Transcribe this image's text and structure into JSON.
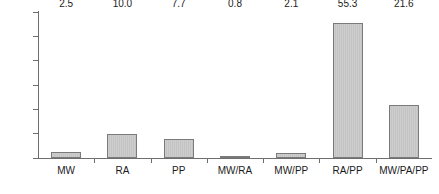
{
  "chart_data": {
    "type": "bar",
    "title": "",
    "subtitle": "",
    "xlabel": "",
    "ylabel": "",
    "categories": [
      "MW",
      "RA",
      "PP",
      "MW/RA",
      "MW/PP",
      "RA/PP",
      "MW/PA/PP"
    ],
    "values": [
      2.5,
      10.0,
      7.7,
      0.8,
      2.1,
      55.3,
      21.6
    ],
    "data_labels": [
      "2.5",
      "10.0",
      "7.7",
      "0.8",
      "2.1",
      "55.3",
      "21.6"
    ],
    "ylim": [
      0,
      60
    ],
    "ytick_values": [
      0,
      10,
      20,
      30,
      40,
      50,
      60
    ],
    "ytick_labels": [
      "0",
      "10",
      "20",
      "30",
      "40",
      "50",
      "60"
    ],
    "grid": false,
    "legend": null,
    "legend_position": "none",
    "series": [
      {
        "name": "",
        "values": [
          2.5,
          10.0,
          7.7,
          0.8,
          2.1,
          55.3,
          21.6
        ]
      }
    ],
    "colors": {
      "bar_fill": "#c9c9c9",
      "bar_border": "#7a7a7a",
      "axis": "#6e6e6e",
      "text": "#1a1a1a",
      "background": "#ffffff"
    }
  }
}
